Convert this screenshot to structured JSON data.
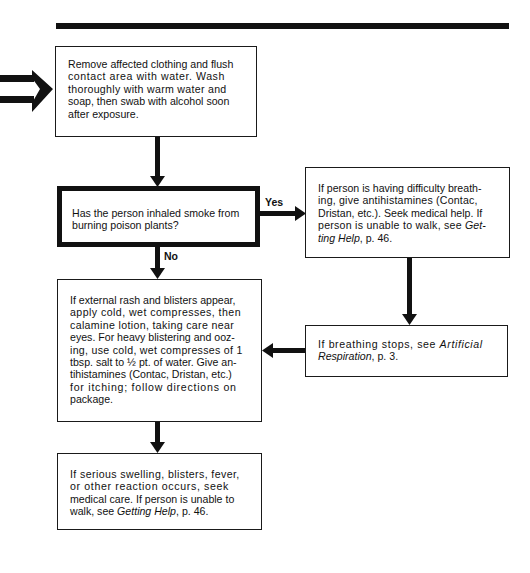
{
  "diagram": {
    "type": "flowchart",
    "topic": "Poison plant exposure first aid",
    "colors": {
      "ink": "#111111",
      "paper": "#ffffff"
    },
    "nodes": {
      "start": {
        "lines": [
          "Remove affected clothing and flush",
          "contact area with water. Wash",
          "thoroughly with warm water and",
          "soap, then swab with alcohol soon",
          "after exposure."
        ]
      },
      "decision": {
        "lines": [
          "Has the person inhaled smoke from",
          "burning poison plants?"
        ]
      },
      "yes_branch": {
        "line1": "If person is having difficulty breath-",
        "line2": "ing, give antihistamines (Contac,",
        "line3": "Dristan, etc.). Seek medical help. If",
        "line4_pre": "person is unable to walk, see ",
        "line4_ital": "Get-",
        "line5_ital": "ting Help",
        "line5_post": ", p. 46."
      },
      "breathing_stops": {
        "line1_pre": "If breathing stops, see ",
        "line1_ital": "Artificial",
        "line2_ital": "Respiration",
        "line2_post": ", p. 3."
      },
      "no_branch": {
        "lines": [
          "If external rash and blisters appear,",
          "apply cold, wet compresses, then",
          "calamine lotion, taking care near",
          "eyes. For heavy blistering and ooz-",
          "ing, use cold, wet compresses of 1",
          "tbsp. salt to ½ pt. of water. Give an-",
          "tihistamines (Contac, Dristan, etc.)",
          "for itching; follow directions on",
          "package."
        ]
      },
      "final": {
        "line1": "If serious swelling, blisters, fever,",
        "line2": "or other reaction occurs, seek",
        "line3": "medical care. If person is unable to",
        "line4_pre": "walk, see ",
        "line4_ital": "Getting Help",
        "line4_post": ", p. 46."
      }
    },
    "edge_labels": {
      "yes": "Yes",
      "no": "No"
    },
    "icons": {
      "entry_arrow": "double-arrow-right-icon"
    }
  }
}
